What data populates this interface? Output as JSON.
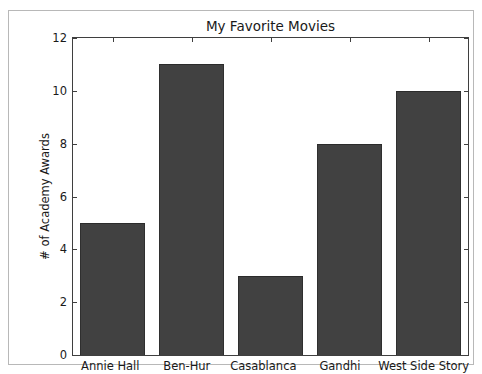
{
  "chart_data": {
    "type": "bar",
    "title": "My Favorite Movies",
    "xlabel": "",
    "ylabel": "# of Academy Awards",
    "categories": [
      "Annie Hall",
      "Ben-Hur",
      "Casablanca",
      "Gandhi",
      "West Side Story"
    ],
    "values": [
      5,
      11,
      3,
      8,
      10
    ],
    "ylim": [
      0,
      12
    ],
    "ytick_values": [
      0,
      2,
      4,
      6,
      8,
      10,
      12
    ],
    "ytick_labels": [
      "0",
      "2",
      "4",
      "6",
      "8",
      "10",
      "12"
    ],
    "grid": false,
    "legend": null,
    "bar_color": "#414141",
    "background_color": "#ffffff",
    "axis_color": "#3f3f3f",
    "text_color": "#1a1a1a"
  }
}
